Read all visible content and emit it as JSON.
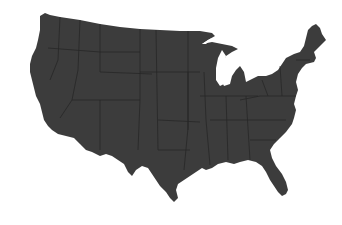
{
  "map": {
    "title": "Contiguous United States",
    "fill_color": "#3c3c3c",
    "border_color": "#1e1e1e",
    "background_color": "#ffffff",
    "lakes_color": "#ffffff"
  }
}
